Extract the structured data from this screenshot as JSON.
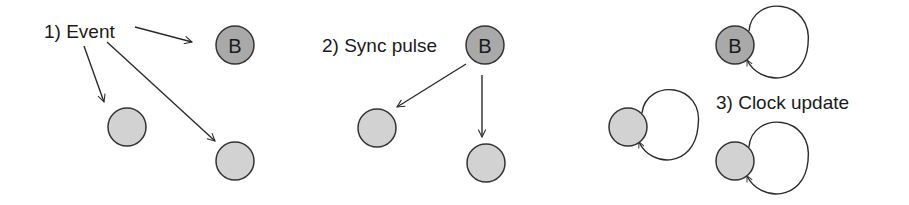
{
  "colors": {
    "background": "#ffffff",
    "beacon_fill": "#a9a9a9",
    "node_fill": "#d2d2d2",
    "stroke": "#333333",
    "text": "#1a1a1a"
  },
  "panels": [
    {
      "id": "event",
      "label": "1) Event",
      "label_pos": [
        44,
        38
      ],
      "nodes": [
        {
          "id": "B",
          "letter": "B",
          "type": "beacon",
          "cx": 235,
          "cy": 45,
          "r": 19
        },
        {
          "id": "n1",
          "letter": "",
          "type": "node",
          "cx": 127,
          "cy": 127,
          "r": 19
        },
        {
          "id": "n2",
          "letter": "",
          "type": "node",
          "cx": 235,
          "cy": 161,
          "r": 19
        }
      ],
      "edges": [
        {
          "from": "label",
          "to": "B",
          "x1": 135,
          "y1": 27,
          "x2": 192,
          "y2": 42
        },
        {
          "from": "label",
          "to": "n1",
          "x1": 84,
          "y1": 46,
          "x2": 104,
          "y2": 102
        },
        {
          "from": "label",
          "to": "n2",
          "x1": 107,
          "y1": 42,
          "x2": 215,
          "y2": 141
        }
      ]
    },
    {
      "id": "sync",
      "label": "2) Sync pulse",
      "label_pos": [
        322,
        52
      ],
      "nodes": [
        {
          "id": "B",
          "letter": "B",
          "type": "beacon",
          "cx": 485,
          "cy": 45,
          "r": 19
        },
        {
          "id": "n1",
          "letter": "",
          "type": "node",
          "cx": 377,
          "cy": 128,
          "r": 19
        },
        {
          "id": "n2",
          "letter": "",
          "type": "node",
          "cx": 486,
          "cy": 163,
          "r": 19
        }
      ],
      "edges": [
        {
          "from": "B",
          "to": "n1",
          "x1": 466,
          "y1": 64,
          "x2": 397,
          "y2": 107
        },
        {
          "from": "B",
          "to": "n2",
          "x1": 482,
          "y1": 75,
          "x2": 482,
          "y2": 137
        }
      ]
    },
    {
      "id": "clock",
      "label": "3) Clock update",
      "label_pos": [
        716,
        109
      ],
      "nodes": [
        {
          "id": "B",
          "letter": "B",
          "type": "beacon",
          "cx": 735,
          "cy": 45,
          "r": 19
        },
        {
          "id": "n1",
          "letter": "",
          "type": "node",
          "cx": 628,
          "cy": 127,
          "r": 19
        },
        {
          "id": "n2",
          "letter": "",
          "type": "node",
          "cx": 735,
          "cy": 161,
          "r": 19
        }
      ],
      "self_loops": [
        {
          "node": "B",
          "path": "M 749 31 C 752 -6, 814 -2, 808 45 C 804 86, 760 86, 747 60"
        },
        {
          "node": "n1",
          "path": "M 642 113 C 646 78, 705 82, 698 127 C 694 168, 651 168, 639 142"
        },
        {
          "node": "n2",
          "path": "M 749 147 C 752 110, 814 114, 808 161 C 804 202, 760 202, 747 176"
        }
      ]
    }
  ]
}
